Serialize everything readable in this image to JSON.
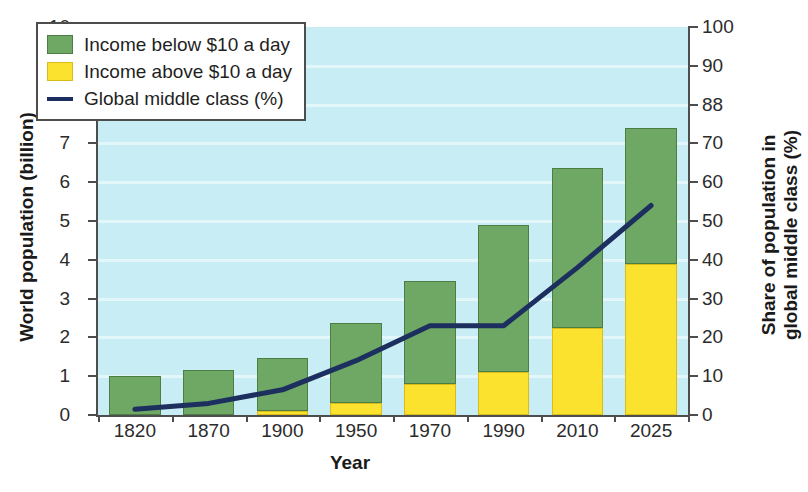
{
  "chart_data": {
    "type": "bar",
    "title": "",
    "xlabel": "Year",
    "ylabel": "World population (billion)",
    "ylabel_right_line1": "Share of population in",
    "ylabel_right_line2": "global middle class (%)",
    "categories": [
      "1820",
      "1870",
      "1900",
      "1950",
      "1970",
      "1990",
      "2010",
      "2025"
    ],
    "ylim": [
      0,
      10
    ],
    "ylim_right": [
      0,
      100
    ],
    "yticks": [
      "0",
      "1",
      "2",
      "3",
      "4",
      "5",
      "6",
      "7",
      "8",
      "9",
      "10"
    ],
    "yticks_right": [
      "0",
      "10",
      "20",
      "30",
      "40",
      "50",
      "60",
      "70",
      "88",
      "90",
      "100"
    ],
    "grid": true,
    "legend_position": "upper-left",
    "plot_background": "#c8edf5",
    "series": [
      {
        "name": "Income below $10 a day",
        "type": "bar-segment",
        "color": "#6fa864",
        "axis": "left",
        "values": [
          1.0,
          1.17,
          1.37,
          2.07,
          2.65,
          3.78,
          4.12,
          3.5
        ]
      },
      {
        "name": "Income above $10 a day",
        "type": "bar-segment",
        "color": "#fbe22e",
        "axis": "left",
        "values": [
          0.0,
          0.0,
          0.1,
          0.3,
          0.8,
          1.12,
          2.25,
          3.9
        ]
      },
      {
        "name": "Global middle class (%)",
        "type": "line",
        "color": "#1c2f5e",
        "axis": "right",
        "values": [
          1.5,
          3,
          6.5,
          14,
          23,
          23,
          38,
          54
        ]
      }
    ],
    "bar_totals": [
      1.0,
      1.17,
      1.47,
      2.37,
      3.45,
      4.9,
      6.37,
      7.4
    ]
  },
  "legend": {
    "items": [
      {
        "label": "Income below $10 a day",
        "swatch": "green-square-swatch"
      },
      {
        "label": "Income above $10 a day",
        "swatch": "yellow-square-swatch"
      },
      {
        "label": "Global middle class (%)",
        "swatch": "navy-line-swatch"
      }
    ]
  }
}
